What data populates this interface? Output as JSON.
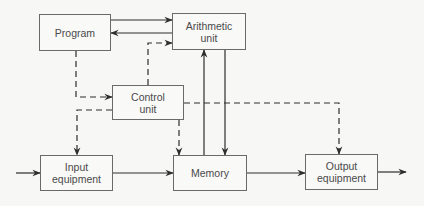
{
  "diagram": {
    "title": "",
    "colors": {
      "background": "#f7f7f6",
      "box_border": "#6a6a6a",
      "line": "#2e2e2e",
      "text": "#4a4a4a"
    },
    "nodes": {
      "program": {
        "label": "Program",
        "x": 39,
        "y": 14,
        "w": 72,
        "h": 37
      },
      "arithmetic": {
        "label": "Arithmetic\nunit",
        "x": 172,
        "y": 13,
        "w": 74,
        "h": 37
      },
      "control": {
        "label": "Control\nunit",
        "x": 112,
        "y": 85,
        "w": 72,
        "h": 35
      },
      "input": {
        "label": "Input\nequipment",
        "x": 40,
        "y": 155,
        "w": 73,
        "h": 36
      },
      "memory": {
        "label": "Memory",
        "x": 173,
        "y": 155,
        "w": 74,
        "h": 36
      },
      "output": {
        "label": "Output\nequipment",
        "x": 305,
        "y": 154,
        "w": 73,
        "h": 36
      }
    },
    "edges": [
      {
        "from": "program",
        "to": "arithmetic",
        "style": "solid",
        "points": [
          [
            111,
            20
          ],
          [
            172,
            20
          ]
        ]
      },
      {
        "from": "arithmetic",
        "to": "program",
        "style": "solid",
        "points": [
          [
            172,
            33
          ],
          [
            111,
            33
          ]
        ]
      },
      {
        "from": "control",
        "to": "arithmetic",
        "style": "dashed",
        "points": [
          [
            148,
            85
          ],
          [
            148,
            43
          ],
          [
            172,
            43
          ]
        ]
      },
      {
        "from": "program",
        "to": "control",
        "style": "dashed",
        "points": [
          [
            76,
            51
          ],
          [
            76,
            97
          ],
          [
            112,
            97
          ]
        ]
      },
      {
        "from": "control",
        "to": "input",
        "style": "dashed",
        "points": [
          [
            112,
            110
          ],
          [
            77,
            110
          ],
          [
            77,
            155
          ]
        ]
      },
      {
        "from": "control",
        "to": "memory",
        "style": "dashed",
        "points": [
          [
            179,
            120
          ],
          [
            179,
            155
          ]
        ]
      },
      {
        "from": "control",
        "to": "output",
        "style": "dashed",
        "points": [
          [
            184,
            103
          ],
          [
            339,
            103
          ],
          [
            339,
            154
          ]
        ]
      },
      {
        "from": "memory",
        "to": "arithmetic",
        "style": "solid",
        "points": [
          [
            204,
            155
          ],
          [
            204,
            50
          ]
        ]
      },
      {
        "from": "arithmetic",
        "to": "memory",
        "style": "solid",
        "points": [
          [
            225,
            50
          ],
          [
            225,
            155
          ]
        ]
      },
      {
        "from": "external",
        "to": "input",
        "style": "solid",
        "points": [
          [
            16,
            173
          ],
          [
            40,
            173
          ]
        ]
      },
      {
        "from": "input",
        "to": "memory",
        "style": "solid",
        "points": [
          [
            113,
            173
          ],
          [
            173,
            173
          ]
        ]
      },
      {
        "from": "memory",
        "to": "output",
        "style": "solid",
        "points": [
          [
            247,
            173
          ],
          [
            305,
            173
          ]
        ]
      },
      {
        "from": "output",
        "to": "external",
        "style": "solid",
        "points": [
          [
            378,
            172
          ],
          [
            406,
            172
          ]
        ]
      }
    ]
  }
}
